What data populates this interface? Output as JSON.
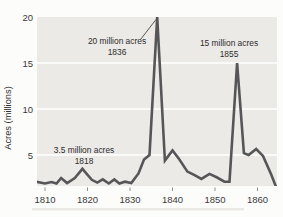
{
  "colors": {
    "page_bg": "#fcfcfa",
    "plot_bg": "#eceae7",
    "gridline": "#ffffff",
    "line": "#565658",
    "leader_line": "#454545",
    "tick": "#8f8f8f",
    "text": "#333333"
  },
  "chart_data": {
    "type": "line",
    "title": "",
    "xlabel": "",
    "ylabel": "Acres (millions)",
    "x_tick_labels": [
      "1810",
      "1820",
      "1830",
      "1840",
      "1850",
      "1860"
    ],
    "x_tick_years": [
      1810,
      1820,
      1830,
      1840,
      1850,
      1860
    ],
    "y_tick_labels": [
      "5",
      "10",
      "15",
      "20"
    ],
    "y_tick_values": [
      5,
      10,
      15,
      20
    ],
    "grid_values": [
      5,
      10,
      15
    ],
    "xlim": [
      1808,
      1864.5
    ],
    "ylim": [
      0,
      20
    ],
    "visible_value_floor": 1.6,
    "grid": "horizontal-white-on-shaded-band",
    "legend": "none",
    "series": [
      {
        "name": "Acres of public land sold (millions)",
        "points": [
          [
            1808.0,
            2.1
          ],
          [
            1810.0,
            1.9
          ],
          [
            1811.5,
            2.05
          ],
          [
            1812.7,
            1.9
          ],
          [
            1813.8,
            2.5
          ],
          [
            1815.2,
            1.95
          ],
          [
            1817.0,
            2.5
          ],
          [
            1818.8,
            3.5
          ],
          [
            1821.0,
            2.3
          ],
          [
            1822.3,
            2.0
          ],
          [
            1823.6,
            2.35
          ],
          [
            1825.0,
            1.9
          ],
          [
            1826.3,
            2.35
          ],
          [
            1827.5,
            1.9
          ],
          [
            1828.8,
            2.1
          ],
          [
            1830.3,
            1.95
          ],
          [
            1832.0,
            3.0
          ],
          [
            1833.3,
            4.5
          ],
          [
            1834.6,
            5.0
          ],
          [
            1836.4,
            20.0
          ],
          [
            1838.2,
            4.4
          ],
          [
            1840.0,
            5.5
          ],
          [
            1841.5,
            4.6
          ],
          [
            1843.5,
            3.2
          ],
          [
            1845.2,
            2.8
          ],
          [
            1846.8,
            2.4
          ],
          [
            1848.7,
            2.95
          ],
          [
            1850.5,
            2.55
          ],
          [
            1852.2,
            2.1
          ],
          [
            1853.4,
            2.1
          ],
          [
            1855.2,
            15.0
          ],
          [
            1856.8,
            5.2
          ],
          [
            1857.9,
            5.0
          ],
          [
            1859.7,
            5.65
          ],
          [
            1861.3,
            4.9
          ],
          [
            1863.2,
            2.9
          ],
          [
            1864.4,
            1.5
          ]
        ]
      }
    ],
    "annotations": [
      {
        "id": "peak-1836",
        "lines": [
          "20 million acres",
          "1836"
        ],
        "year": 1836,
        "value": 20,
        "label_cx": 117,
        "label_y1": 44,
        "label_y2": 55,
        "leader": [
          140.5,
          39.5,
          156,
          19.5
        ]
      },
      {
        "id": "peak-1855",
        "lines": [
          "15 million acres",
          "1855"
        ],
        "year": 1855,
        "value": 15,
        "label_cx": 229,
        "label_y1": 46,
        "label_y2": 57,
        "leader": null
      },
      {
        "id": "peak-1818",
        "lines": [
          "3.5 million acres",
          "1818"
        ],
        "year": 1818,
        "value": 3.5,
        "label_cx": 84,
        "label_y1": 153,
        "label_y2": 164,
        "leader": null
      }
    ]
  }
}
